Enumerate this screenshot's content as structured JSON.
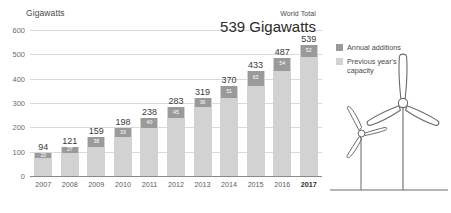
{
  "chart_data": {
    "type": "bar",
    "title": "",
    "subtitle": "",
    "ylabel": "Gigawatts",
    "xlabel": "",
    "ylim": [
      0,
      600
    ],
    "yticks": [
      0,
      100,
      200,
      300,
      400,
      500,
      600
    ],
    "grid": true,
    "legend_position": "right",
    "categories": [
      "2007",
      "2008",
      "2009",
      "2010",
      "2011",
      "2012",
      "2013",
      "2014",
      "2015",
      "2016",
      "2017"
    ],
    "values": [
      94,
      121,
      159,
      198,
      238,
      283,
      319,
      370,
      433,
      487,
      539
    ],
    "series": [
      {
        "name": "Previous year's capacity",
        "values": [
          74,
          94,
          121,
          159,
          198,
          238,
          283,
          319,
          370,
          433,
          487
        ],
        "color": "#d2d2d2"
      },
      {
        "name": "Annual additions",
        "values": [
          20,
          27,
          38,
          39,
          40,
          45,
          36,
          51,
          63,
          54,
          52
        ],
        "color": "#9a9a9a"
      }
    ],
    "annotations": [
      {
        "text": "World Total",
        "value": "539 Gigawatts"
      }
    ],
    "highlighted_category": "2017"
  },
  "axis": {
    "y_title": "Gigawatts",
    "y_ticks": [
      "600",
      "500",
      "400",
      "300",
      "200",
      "100",
      "0"
    ],
    "x_ticks": [
      "2007",
      "2008",
      "2009",
      "2010",
      "2011",
      "2012",
      "2013",
      "2014",
      "2015",
      "2016",
      "2017"
    ]
  },
  "bar_labels": {
    "totals": [
      "94",
      "121",
      "159",
      "198",
      "238",
      "283",
      "319",
      "370",
      "433",
      "487",
      "539"
    ],
    "additions": [
      "20",
      "27",
      "38",
      "39",
      "40",
      "45",
      "36",
      "51",
      "63",
      "54",
      "52"
    ]
  },
  "callout": {
    "eyebrow": "World Total",
    "value": "539 Gigawatts"
  },
  "legend": {
    "items": [
      {
        "label": "Annual additions",
        "color": "#9a9a9a"
      },
      {
        "label": "Previous year's capacity",
        "color": "#d2d2d2"
      }
    ]
  },
  "illustration": {
    "name": "wind-turbines",
    "stroke_color": "#6b6b6b"
  }
}
